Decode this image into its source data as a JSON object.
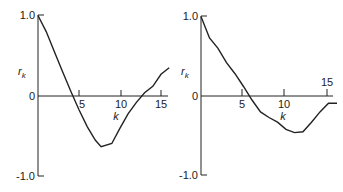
{
  "chart_data": [
    {
      "type": "line",
      "title": "",
      "xlabel": "k",
      "ylabel": "r_k",
      "ylim": [
        -1.0,
        1.0
      ],
      "xlim": [
        0,
        16
      ],
      "y_ticks": [
        "1.0",
        "0",
        "-1.0"
      ],
      "x_ticks": [
        "5",
        "10",
        "15"
      ],
      "grid": false,
      "x": [
        0,
        1,
        2,
        3,
        4,
        5,
        6,
        7,
        7.7,
        9,
        10,
        11,
        12,
        13,
        14,
        15,
        16
      ],
      "values": [
        1.0,
        0.8,
        0.55,
        0.3,
        0.06,
        -0.17,
        -0.38,
        -0.55,
        -0.63,
        -0.59,
        -0.4,
        -0.22,
        -0.08,
        0.04,
        0.12,
        0.27,
        0.35
      ]
    },
    {
      "type": "line",
      "title": "",
      "xlabel": "k",
      "ylabel": "r_k",
      "ylim": [
        -1.0,
        1.0
      ],
      "xlim": [
        0,
        16
      ],
      "y_ticks": [
        "1.0",
        "0",
        "-1.0"
      ],
      "x_ticks": [
        "5",
        "10",
        "15"
      ],
      "grid": false,
      "x": [
        0,
        1,
        2,
        3,
        4,
        5,
        6,
        7,
        8,
        9,
        10,
        11,
        12,
        13,
        14,
        15,
        16
      ],
      "values": [
        1.0,
        0.73,
        0.6,
        0.42,
        0.28,
        0.12,
        -0.05,
        -0.2,
        -0.27,
        -0.33,
        -0.42,
        -0.46,
        -0.45,
        -0.33,
        -0.2,
        -0.09,
        -0.09
      ]
    }
  ],
  "left": {
    "ylabel": "r",
    "ylabel_sub": "k",
    "xlabel": "k",
    "ytick_top": "1.0",
    "ytick_zero": "0",
    "ytick_bottom": "-1.0",
    "xt5": "5",
    "xt10": "10",
    "xt15": "15"
  },
  "right": {
    "ylabel": "r",
    "ylabel_sub": "k",
    "xlabel": "k",
    "ytick_top": "1.0",
    "ytick_zero": "0",
    "ytick_bottom": "-1.0",
    "xt5": "5",
    "xt10": "10",
    "xt15": "15"
  }
}
